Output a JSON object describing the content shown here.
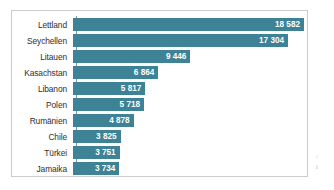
{
  "chart_data": {
    "type": "bar",
    "orientation": "horizontal",
    "title": "",
    "subtitle": "",
    "xlabel": "",
    "ylabel": "",
    "categories": [
      "Lettland",
      "Seychellen",
      "Litauen",
      "Kasachstan",
      "Libanon",
      "Polen",
      "Rumänien",
      "Chile",
      "Türkei",
      "Jamaika"
    ],
    "values": [
      18582,
      17304,
      9446,
      6864,
      5817,
      5718,
      4878,
      3825,
      3751,
      3734
    ],
    "value_labels": [
      "18 582",
      "17 304",
      "9 446",
      "6 864",
      "5 817",
      "5 718",
      "4 878",
      "3 825",
      "3 751",
      "3 734"
    ],
    "xlim": [
      0,
      18582
    ],
    "grid": false,
    "legend": null,
    "bar_color": "#3d8295",
    "value_label_color": "#ffffff",
    "category_label_color": "#2e2e2e",
    "axis_color": "#8d9296",
    "frame_color": "#c9cdd0",
    "background": "#ffffff"
  },
  "bars": [
    {
      "category": "Lettland",
      "value": 18582,
      "label": "18 582"
    },
    {
      "category": "Seychellen",
      "value": 17304,
      "label": "17 304"
    },
    {
      "category": "Litauen",
      "value": 9446,
      "label": "9 446"
    },
    {
      "category": "Kasachstan",
      "value": 6864,
      "label": "6 864"
    },
    {
      "category": "Libanon",
      "value": 5817,
      "label": "5 817"
    },
    {
      "category": "Polen",
      "value": 5718,
      "label": "5 718"
    },
    {
      "category": "Rumänien",
      "value": 4878,
      "label": "4 878"
    },
    {
      "category": "Chile",
      "value": 3825,
      "label": "3 825"
    },
    {
      "category": "Türkei",
      "value": 3751,
      "label": "3 751"
    },
    {
      "category": "Jamaika",
      "value": 3734,
      "label": "3 734"
    }
  ],
  "margin_marks": [
    "/",
    "i"
  ]
}
